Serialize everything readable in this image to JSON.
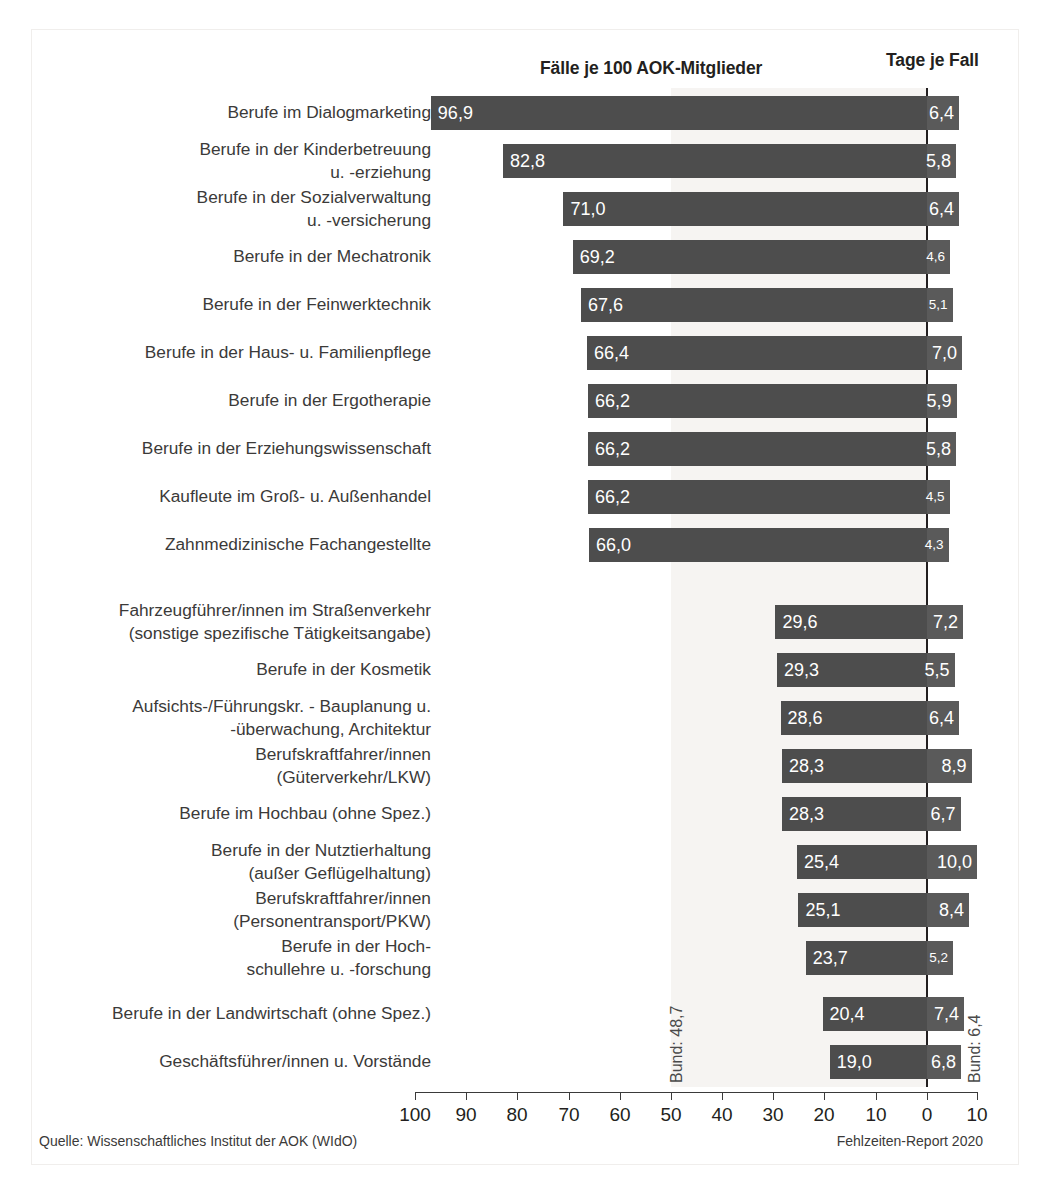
{
  "headers": {
    "left_column": "Fälle je 100 AOK-Mitglieder",
    "right_column": "Tage je Fall"
  },
  "annotations": {
    "bund_left": "Bund: 48,7",
    "bund_right": "Bund: 6,4"
  },
  "footer": {
    "source": "Quelle: Wissenschaftliches Institut der AOK (WIdO)",
    "report": "Fehlzeiten-Report 2020"
  },
  "axis": {
    "ticks": [
      {
        "label": "100",
        "x": 415
      },
      {
        "label": "90",
        "x": 466
      },
      {
        "label": "80",
        "x": 517
      },
      {
        "label": "70",
        "x": 569
      },
      {
        "label": "60",
        "x": 620
      },
      {
        "label": "50",
        "x": 671
      },
      {
        "label": "40",
        "x": 722
      },
      {
        "label": "30",
        "x": 773
      },
      {
        "label": "20",
        "x": 824
      },
      {
        "label": "10",
        "x": 876
      },
      {
        "label": "0",
        "x": 927
      },
      {
        "label": "10",
        "x": 977
      }
    ]
  },
  "chart_data": {
    "type": "bar",
    "xlabel": "",
    "ylabel": "",
    "grid": false,
    "legend": "none",
    "orientation": "horizontal-diverging",
    "left_axis": {
      "label": "Fälle je 100 AOK-Mitglieder",
      "range": [
        100,
        0
      ],
      "ticks": [
        100,
        90,
        80,
        70,
        60,
        50,
        40,
        30,
        20,
        10,
        0
      ],
      "direction": "right-to-left"
    },
    "right_axis": {
      "label": "Tage je Fall",
      "range": [
        0,
        10
      ],
      "ticks": [
        0,
        10
      ],
      "direction": "left-to-right"
    },
    "reference_lines": [
      {
        "name": "Bund (Fälle)",
        "value": 48.7,
        "axis": "left",
        "label": "Bund: 48,7"
      },
      {
        "name": "Bund (Tage)",
        "value": 6.4,
        "axis": "right",
        "label": "Bund: 6,4"
      }
    ],
    "categories": [
      "Berufe im Dialogmarketing",
      "Berufe in der Kinderbetreuung\nu. -erziehung",
      "Berufe in der Sozialverwaltung\nu. -versicherung",
      "Berufe in der Mechatronik",
      "Berufe in der Feinwerktechnik",
      "Berufe in der Haus- u. Familienpflege",
      "Berufe in der Ergotherapie",
      "Berufe in der Erziehungswissenschaft",
      "Kaufleute im Groß- u. Außenhandel",
      "Zahnmedizinische Fachangestellte",
      "Fahrzeugführer/innen im Straßenverkehr\n(sonstige spezifische Tätigkeitsangabe)",
      "Berufe in der Kosmetik",
      "Aufsichts-/Führungskr. - Bauplanung u.\n-überwachung, Architektur",
      "Berufskraftfahrer/innen\n(Güterverkehr/LKW)",
      "Berufe im Hochbau (ohne Spez.)",
      "Berufe in der Nutztierhaltung\n(außer Geflügelhaltung)",
      "Berufskraftfahrer/innen\n(Personentransport/PKW)",
      "Berufe in der Hoch-\nschullehre u. -forschung",
      "Berufe in der Landwirtschaft (ohne Spez.)",
      "Geschäftsführer/innen u. Vorstände"
    ],
    "series": [
      {
        "name": "Fälle je 100 AOK-Mitglieder",
        "values": [
          96.9,
          82.8,
          71.0,
          69.2,
          67.6,
          66.4,
          66.2,
          66.2,
          66.2,
          66.0,
          29.6,
          29.3,
          28.6,
          28.3,
          28.3,
          25.4,
          25.1,
          23.7,
          20.4,
          19.0
        ],
        "labels": [
          "96,9",
          "82,8",
          "71,0",
          "69,2",
          "67,6",
          "66,4",
          "66,2",
          "66,2",
          "66,2",
          "66,0",
          "29,6",
          "29,3",
          "28,6",
          "28,3",
          "28,3",
          "25,4",
          "25,1",
          "23,7",
          "20,4",
          "19,0"
        ]
      },
      {
        "name": "Tage je Fall",
        "values": [
          6.4,
          5.8,
          6.4,
          4.6,
          5.1,
          7.0,
          5.9,
          5.8,
          4.5,
          4.3,
          7.2,
          5.5,
          6.4,
          8.9,
          6.7,
          10.0,
          8.4,
          5.2,
          7.4,
          6.8
        ],
        "labels": [
          "6,4",
          "5,8",
          "6,4",
          "4,6",
          "5,1",
          "7,0",
          "5,9",
          "5,8",
          "4,5",
          "4,3",
          "7,2",
          "5,5",
          "6,4",
          "8,9",
          "6,7",
          "10,0",
          "8,4",
          "5,2",
          "7,4",
          "6,8"
        ]
      }
    ],
    "rows": [
      {
        "label": "Berufe im Dialogmarketing",
        "lines": 1,
        "top": 96,
        "faelle": 96.9,
        "faelle_label": "96,9",
        "tage": 6.4,
        "tage_label": "6,4"
      },
      {
        "label": "Berufe in der Kinderbetreuung\nu. -erziehung",
        "lines": 2,
        "top": 144,
        "faelle": 82.8,
        "faelle_label": "82,8",
        "tage": 5.8,
        "tage_label": "5,8"
      },
      {
        "label": "Berufe in der Sozialverwaltung\nu. -versicherung",
        "lines": 2,
        "top": 192,
        "faelle": 71.0,
        "faelle_label": "71,0",
        "tage": 6.4,
        "tage_label": "6,4"
      },
      {
        "label": "Berufe in der Mechatronik",
        "lines": 1,
        "top": 240,
        "faelle": 69.2,
        "faelle_label": "69,2",
        "tage": 4.6,
        "tage_label": "4,6"
      },
      {
        "label": "Berufe in der Feinwerktechnik",
        "lines": 1,
        "top": 288,
        "faelle": 67.6,
        "faelle_label": "67,6",
        "tage": 5.1,
        "tage_label": "5,1"
      },
      {
        "label": "Berufe in der Haus- u. Familienpflege",
        "lines": 1,
        "top": 336,
        "faelle": 66.4,
        "faelle_label": "66,4",
        "tage": 7.0,
        "tage_label": "7,0"
      },
      {
        "label": "Berufe in der Ergotherapie",
        "lines": 1,
        "top": 384,
        "faelle": 66.2,
        "faelle_label": "66,2",
        "tage": 5.9,
        "tage_label": "5,9"
      },
      {
        "label": "Berufe in der Erziehungswissenschaft",
        "lines": 1,
        "top": 432,
        "faelle": 66.2,
        "faelle_label": "66,2",
        "tage": 5.8,
        "tage_label": "5,8"
      },
      {
        "label": "Kaufleute im Groß- u. Außenhandel",
        "lines": 1,
        "top": 480,
        "faelle": 66.2,
        "faelle_label": "66,2",
        "tage": 4.5,
        "tage_label": "4,5"
      },
      {
        "label": "Zahnmedizinische Fachangestellte",
        "lines": 1,
        "top": 528,
        "faelle": 66.0,
        "faelle_label": "66,0",
        "tage": 4.3,
        "tage_label": "4,3"
      },
      {
        "label": "Fahrzeugführer/innen im Straßenverkehr\n(sonstige spezifische Tätigkeitsangabe)",
        "lines": 2,
        "top": 605,
        "faelle": 29.6,
        "faelle_label": "29,6",
        "tage": 7.2,
        "tage_label": "7,2"
      },
      {
        "label": "Berufe in der Kosmetik",
        "lines": 1,
        "top": 653,
        "faelle": 29.3,
        "faelle_label": "29,3",
        "tage": 5.5,
        "tage_label": "5,5"
      },
      {
        "label": "Aufsichts-/Führungskr. - Bauplanung u.\n-überwachung, Architektur",
        "lines": 2,
        "top": 701,
        "faelle": 28.6,
        "faelle_label": "28,6",
        "tage": 6.4,
        "tage_label": "6,4"
      },
      {
        "label": "Berufskraftfahrer/innen\n(Güterverkehr/LKW)",
        "lines": 2,
        "top": 749,
        "faelle": 28.3,
        "faelle_label": "28,3",
        "tage": 8.9,
        "tage_label": "8,9"
      },
      {
        "label": "Berufe im Hochbau (ohne Spez.)",
        "lines": 1,
        "top": 797,
        "faelle": 28.3,
        "faelle_label": "28,3",
        "tage": 6.7,
        "tage_label": "6,7"
      },
      {
        "label": "Berufe in der Nutztierhaltung\n(außer Geflügelhaltung)",
        "lines": 2,
        "top": 845,
        "faelle": 25.4,
        "faelle_label": "25,4",
        "tage": 10.0,
        "tage_label": "10,0"
      },
      {
        "label": "Berufskraftfahrer/innen\n(Personentransport/PKW)",
        "lines": 2,
        "top": 893,
        "faelle": 25.1,
        "faelle_label": "25,1",
        "tage": 8.4,
        "tage_label": "8,4"
      },
      {
        "label": "Berufe in der Hoch-\nschullehre u. -forschung",
        "lines": 2,
        "top": 941,
        "faelle": 23.7,
        "faelle_label": "23,7",
        "tage": 5.2,
        "tage_label": "5,2"
      },
      {
        "label": "Berufe in der Landwirtschaft (ohne Spez.)",
        "lines": 1,
        "top": 997,
        "faelle": 20.4,
        "faelle_label": "20,4",
        "tage": 7.4,
        "tage_label": "7,4"
      },
      {
        "label": "Geschäftsführer/innen u. Vorstände",
        "lines": 1,
        "top": 1045,
        "faelle": 19.0,
        "faelle_label": "19,0",
        "tage": 6.8,
        "tage_label": "6,8"
      }
    ]
  }
}
